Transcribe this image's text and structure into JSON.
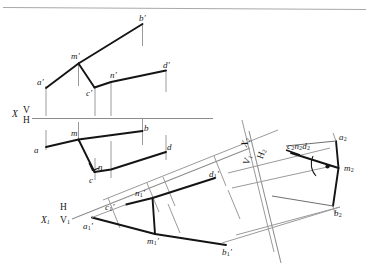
{
  "figure": {
    "background": "#ffffff",
    "ink": "#1a1a1a",
    "thin_line": "#8d8d8d",
    "medium_line": "#6f6f6f",
    "top_rule_color": "#a8a8a8"
  },
  "axes": {
    "main": {
      "x_letter": "X",
      "upper": "V",
      "lower": "H"
    },
    "aux1": {
      "x_letter": "X",
      "x_sub": "1",
      "upper": "H",
      "lower": "V",
      "lower_sub": "1"
    },
    "aux2": {
      "x_letter": "X",
      "x_sub": "2",
      "upper": "V",
      "upper_sub": "1",
      "lower": "H",
      "lower_sub": "2"
    }
  },
  "views": {
    "frontal": {
      "name": "front view",
      "points": [
        {
          "id": "a-prime",
          "label": "a",
          "prime": "′"
        },
        {
          "id": "b-prime",
          "label": "b",
          "prime": "′"
        },
        {
          "id": "c-prime",
          "label": "c",
          "prime": "′"
        },
        {
          "id": "d-prime",
          "label": "d",
          "prime": "′"
        },
        {
          "id": "m-prime",
          "label": "m",
          "prime": "′"
        },
        {
          "id": "n-prime",
          "label": "n",
          "prime": "′"
        }
      ]
    },
    "horizontal": {
      "name": "top view",
      "points": [
        {
          "id": "a",
          "label": "a",
          "prime": ""
        },
        {
          "id": "b",
          "label": "b",
          "prime": ""
        },
        {
          "id": "c",
          "label": "c",
          "prime": ""
        },
        {
          "id": "d",
          "label": "d",
          "prime": ""
        },
        {
          "id": "m",
          "label": "m",
          "prime": ""
        },
        {
          "id": "n",
          "label": "n",
          "prime": ""
        }
      ]
    },
    "auxiliary1": {
      "name": "first auxiliary view",
      "points": [
        {
          "id": "a1-prime",
          "label": "a",
          "sub": "1",
          "prime": "′"
        },
        {
          "id": "b1-prime",
          "label": "b",
          "sub": "1",
          "prime": "′"
        },
        {
          "id": "c1-prime",
          "label": "c",
          "sub": "1",
          "prime": "′"
        },
        {
          "id": "d1-prime",
          "label": "d",
          "sub": "1",
          "prime": "′"
        },
        {
          "id": "m1-prime",
          "label": "m",
          "sub": "1",
          "prime": "′"
        },
        {
          "id": "n1-prime",
          "label": "n",
          "sub": "1",
          "prime": "′"
        }
      ]
    },
    "auxiliary2": {
      "name": "second auxiliary view (edge view)",
      "points": [
        {
          "id": "a2",
          "label": "a",
          "sub": "2"
        },
        {
          "id": "b2",
          "label": "b",
          "sub": "2"
        },
        {
          "id": "m2",
          "label": "m",
          "sub": "2"
        }
      ],
      "collapsed_label": {
        "id": "c2n2d2",
        "parts": [
          "c",
          "2",
          "n",
          "2",
          "d",
          "2"
        ]
      },
      "right_angle_marker": true
    }
  }
}
